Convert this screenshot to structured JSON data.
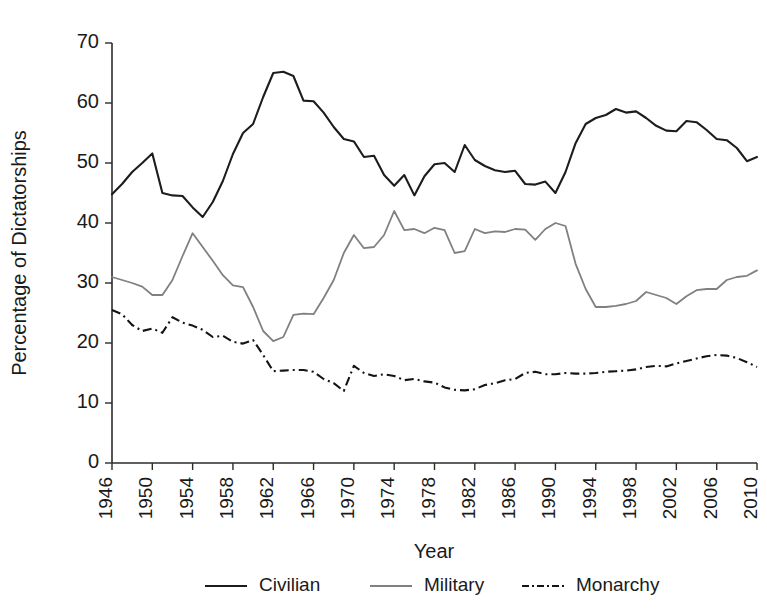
{
  "chart_data": {
    "type": "line",
    "title": "",
    "title_note": "title is cropped off the top edge of the screenshot",
    "xlabel": "Year",
    "ylabel": "Percentage of Dictatorships",
    "xlim": [
      1946,
      2010
    ],
    "ylim": [
      0,
      70
    ],
    "ytick_values": [
      0,
      10,
      20,
      30,
      40,
      50,
      60,
      70
    ],
    "ytick_labels": [
      "0",
      "10",
      "20",
      "30",
      "40",
      "50",
      "60",
      "70"
    ],
    "xtick_values": [
      1946,
      1950,
      1954,
      1958,
      1962,
      1966,
      1970,
      1974,
      1978,
      1982,
      1986,
      1990,
      1994,
      1998,
      2002,
      2006,
      2010
    ],
    "xtick_labels": [
      "1946",
      "1950",
      "1954",
      "1958",
      "1962",
      "1966",
      "1970",
      "1974",
      "1978",
      "1982",
      "1986",
      "1990",
      "1994",
      "1998",
      "2002",
      "2006",
      "2010"
    ],
    "grid": false,
    "legend_position": "below-axis",
    "x": [
      1946,
      1947,
      1948,
      1949,
      1950,
      1951,
      1952,
      1953,
      1954,
      1955,
      1956,
      1957,
      1958,
      1959,
      1960,
      1961,
      1962,
      1963,
      1964,
      1965,
      1966,
      1967,
      1968,
      1969,
      1970,
      1971,
      1972,
      1973,
      1974,
      1975,
      1976,
      1977,
      1978,
      1979,
      1980,
      1981,
      1982,
      1983,
      1984,
      1985,
      1986,
      1987,
      1988,
      1989,
      1990,
      1991,
      1992,
      1993,
      1994,
      1995,
      1996,
      1997,
      1998,
      1999,
      2000,
      2001,
      2002,
      2003,
      2004,
      2005,
      2006,
      2007,
      2008,
      2009,
      2010
    ],
    "series": [
      {
        "name": "Civilian",
        "color": "#1c1c1c",
        "style": "solid",
        "values": [
          44.8,
          46.5,
          48.5,
          50.0,
          51.6,
          45.0,
          44.6,
          44.5,
          42.6,
          41.0,
          43.5,
          47.0,
          51.5,
          55.0,
          56.5,
          61.0,
          65.0,
          65.2,
          64.5,
          60.4,
          60.3,
          58.4,
          56.0,
          54.0,
          53.6,
          51.0,
          51.2,
          48.0,
          46.2,
          48.0,
          44.6,
          47.8,
          49.8,
          50.0,
          48.5,
          53.0,
          50.5,
          49.5,
          48.8,
          48.5,
          48.7,
          46.5,
          46.4,
          46.9,
          45.0,
          48.5,
          53.3,
          56.5,
          57.5,
          58.0,
          59.0,
          58.4,
          58.6,
          57.5,
          56.2,
          55.4,
          55.3,
          57.0,
          56.8,
          55.5,
          54.0,
          53.8,
          52.5,
          50.3,
          51.0
        ]
      },
      {
        "name": "Military",
        "color": "#808080",
        "style": "solid",
        "values": [
          31.0,
          30.5,
          30.0,
          29.4,
          28.0,
          28.0,
          30.5,
          34.5,
          38.3,
          36.0,
          33.7,
          31.3,
          29.6,
          29.3,
          26.0,
          22.0,
          20.3,
          21.0,
          24.7,
          24.9,
          24.8,
          27.5,
          30.5,
          35.0,
          38.0,
          35.8,
          36.0,
          38.0,
          42.0,
          38.8,
          39.0,
          38.3,
          39.2,
          38.8,
          35.0,
          35.3,
          39.0,
          38.3,
          38.6,
          38.5,
          39.0,
          38.9,
          37.2,
          39.0,
          40.0,
          39.5,
          33.2,
          29.0,
          26.0,
          26.0,
          26.2,
          26.5,
          27.0,
          28.5,
          28.0,
          27.5,
          26.5,
          27.8,
          28.8,
          29.0,
          29.0,
          30.5,
          31.0,
          31.2,
          32.1
        ]
      },
      {
        "name": "Monarchy",
        "color": "#141414",
        "style": "dash-dot",
        "values": [
          25.5,
          24.8,
          23.0,
          22.0,
          22.4,
          21.7,
          24.3,
          23.4,
          22.9,
          22.2,
          21.0,
          21.2,
          20.2,
          19.9,
          20.5,
          18.0,
          15.3,
          15.4,
          15.5,
          15.5,
          15.2,
          14.0,
          13.3,
          12.0,
          16.2,
          15.0,
          14.5,
          14.8,
          14.5,
          13.8,
          14.0,
          13.6,
          13.4,
          12.6,
          12.2,
          12.1,
          12.3,
          13.0,
          13.3,
          13.8,
          14.0,
          15.0,
          15.2,
          14.8,
          14.8,
          15.0,
          14.9,
          14.9,
          15.0,
          15.2,
          15.3,
          15.4,
          15.6,
          16.0,
          16.2,
          16.1,
          16.6,
          17.0,
          17.4,
          17.8,
          18.0,
          17.9,
          17.5,
          16.8,
          16.0
        ]
      }
    ]
  },
  "legend": {
    "items": [
      {
        "label": "Civilian"
      },
      {
        "label": "Military"
      },
      {
        "label": "Monarchy"
      }
    ]
  },
  "axes": {
    "ylabel": "Percentage of Dictatorships",
    "xlabel": "Year"
  }
}
